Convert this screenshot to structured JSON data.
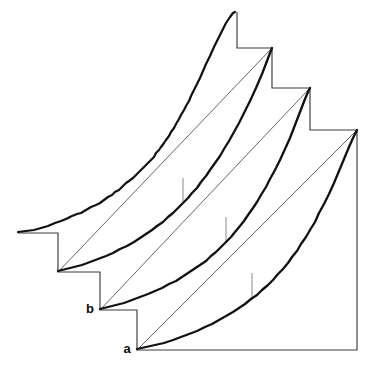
{
  "figure": {
    "kind": "geometric-diagram",
    "background_color": "#ffffff",
    "width": 367,
    "height": 367,
    "stroke_color_curve": "#111111",
    "stroke_color_axis": "#3c3c3c",
    "stroke_color_chord": "#4a4a4a",
    "stroke_color_tick": "#8a8a8a"
  },
  "labels": {
    "point_a": "a",
    "point_b": "b"
  },
  "label_positions": {
    "point_a": {
      "x": 127,
      "y": 350
    },
    "point_b": {
      "x": 90,
      "y": 310
    }
  },
  "staircase": {
    "description": "descending step polyline forming the axes frame",
    "path": "M 18 233 L 58 233 L 58 272 L 100 272 L 100 310 L 137 310 L 137 350 L 357 350 L 357 130 L 310 130 L 310 88 L 272 88 L 272 48 L 237 48 L 237 12"
  },
  "curves": [
    {
      "name": "curve-outer-jagged",
      "style": "jagged",
      "origin": {
        "x": 18,
        "y": 233
      },
      "apex": {
        "x": 235,
        "y": 12
      },
      "path": "M 18 232 L 26 231 L 34 230 L 41 228 L 48 226 L 55 223 L 61 221 L 66 219 L 72 216 L 77 214 L 81 213 L 86 210 L 91 207 L 96 205 L 100 203 L 104 200 L 108 197 L 112 195 L 115 192 L 119 190 L 122 187 L 126 183 L 129 181 L 133 178 L 136 175 L 139 172 L 142 169 L 145 166 L 148 163 L 151 160 L 154 157 L 156 153 L 159 150 L 161 147 L 164 143 L 166 140 L 169 136 L 171 132 L 174 128 L 176 124 L 179 119 L 181 115 L 184 110 L 186 106 L 189 101 L 191 96 L 194 90 L 197 84 L 200 78 L 203 71 L 206 64 L 210 56 L 214 47 L 218 39 L 222 31 L 226 23 L 230 17 L 233 13 L 235 12"
    },
    {
      "name": "curve-second",
      "style": "smooth",
      "origin": {
        "x": 58,
        "y": 272
      },
      "apex": {
        "x": 272,
        "y": 48
      },
      "path": "M 58 271 L 66 269 L 74 267 L 82 265 L 90 262 L 98 259 L 106 256 L 113 253 L 120 249 L 127 246 L 134 242 L 140 238 L 146 234 L 152 230 L 157 226 L 163 222 L 168 217 L 173 213 L 178 208 L 183 203 L 188 198 L 192 193 L 197 188 L 201 182 L 206 176 L 210 170 L 215 163 L 220 156 L 224 149 L 229 141 L 234 132 L 239 123 L 244 113 L 250 101 L 256 88 L 262 74 L 267 61 L 270 53 L 272 48",
      "chord": {
        "x1": 58,
        "y1": 272,
        "x2": 272,
        "y2": 48
      },
      "deviation_tick": {
        "x": 183,
        "y1": 178,
        "y2": 203
      }
    },
    {
      "name": "curve-third",
      "style": "smooth",
      "origin": {
        "x": 100,
        "y": 310
      },
      "apex": {
        "x": 310,
        "y": 88
      },
      "path": "M 100 309 L 108 307 L 116 305 L 124 303 L 132 300 L 140 297 L 148 294 L 155 291 L 162 288 L 169 284 L 176 281 L 182 277 L 188 273 L 194 269 L 200 265 L 206 261 L 211 256 L 216 252 L 221 247 L 226 242 L 231 237 L 235 232 L 240 226 L 244 221 L 248 215 L 253 208 L 257 202 L 261 195 L 266 187 L 270 179 L 275 170 L 280 160 L 285 149 L 290 138 L 295 125 L 300 112 L 305 99 L 308 92 L 310 88",
      "chord": {
        "x1": 100,
        "y1": 310,
        "x2": 310,
        "y2": 88
      },
      "deviation_tick": {
        "x": 226,
        "y1": 217,
        "y2": 242
      }
    },
    {
      "name": "curve-fourth",
      "style": "smooth",
      "origin": {
        "x": 137,
        "y": 350
      },
      "apex": {
        "x": 357,
        "y": 130
      },
      "path": "M 137 349 L 146 347 L 155 345 L 164 343 L 173 340 L 181 337 L 189 334 L 197 331 L 205 327 L 212 324 L 219 320 L 226 316 L 233 312 L 239 308 L 245 304 L 251 299 L 257 295 L 262 290 L 268 285 L 273 280 L 278 274 L 283 269 L 288 263 L 292 257 L 297 251 L 301 244 L 306 237 L 310 230 L 315 222 L 319 213 L 324 204 L 329 194 L 334 183 L 339 171 L 344 159 L 349 147 L 353 138 L 356 132 L 357 130",
      "chord": {
        "x1": 137,
        "y1": 350,
        "x2": 357,
        "y2": 130
      },
      "deviation_tick": {
        "x": 252,
        "y1": 273,
        "y2": 298
      }
    }
  ]
}
